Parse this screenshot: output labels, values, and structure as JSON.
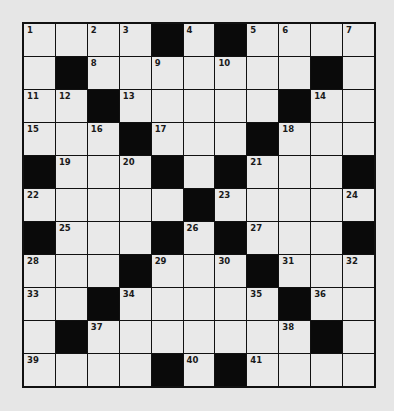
{
  "puzzle": {
    "rows": 11,
    "cols": 11,
    "colors": {
      "background": "#e6e6e6",
      "cell": "#e9e9e9",
      "block": "#0a0a0a",
      "line": "#111111"
    },
    "grid": [
      [
        "1",
        "",
        "2",
        "3",
        "#",
        "4",
        "#",
        "5",
        "6",
        "",
        "7"
      ],
      [
        "",
        "#",
        "8",
        "",
        "9",
        "",
        "10",
        "",
        "",
        "#",
        ""
      ],
      [
        "11",
        "12",
        "#",
        "13",
        "",
        "",
        "",
        "",
        "#",
        "14",
        ""
      ],
      [
        "15",
        "",
        "16",
        "#",
        "17",
        "",
        "",
        "#",
        "18",
        "",
        ""
      ],
      [
        "#",
        "19",
        "",
        "20",
        "#",
        "",
        "#",
        "21",
        "",
        "",
        "#"
      ],
      [
        "22",
        "",
        "",
        "",
        "",
        "#",
        "23",
        "",
        "",
        "",
        "24"
      ],
      [
        "#",
        "25",
        "",
        "",
        "#",
        "26",
        "#",
        "27",
        "",
        "",
        "#"
      ],
      [
        "28",
        "",
        "",
        "#",
        "29",
        "",
        "30",
        "#",
        "31",
        "",
        "32"
      ],
      [
        "33",
        "",
        "#",
        "34",
        "",
        "",
        "",
        "35",
        "#",
        "36",
        ""
      ],
      [
        "",
        "#",
        "37",
        "",
        "",
        "",
        "",
        "",
        "38",
        "#",
        ""
      ],
      [
        "39",
        "",
        "",
        "",
        "#",
        "40",
        "#",
        "41",
        "",
        "",
        ""
      ]
    ]
  }
}
